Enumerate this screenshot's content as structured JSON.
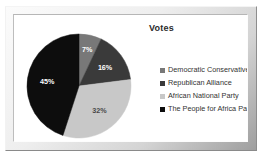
{
  "chart_data": {
    "type": "pie",
    "title": "Votes",
    "xlabel": "",
    "ylabel": "",
    "grid": false,
    "legend_position": "right",
    "value_unit": "%",
    "categories": [
      "Democratic Conservatives",
      "Republican Alliance",
      "African National Party",
      "The People for Africa Party"
    ],
    "values": [
      7,
      16,
      32,
      45
    ],
    "data_labels": [
      "7%",
      "16%",
      "32%",
      "45%"
    ],
    "colors": [
      "#787878",
      "#3a3a3a",
      "#c8c8c8",
      "#0d0d0d"
    ],
    "total": 100
  },
  "chart": {
    "title": "Votes",
    "slices": [
      {
        "label": "7%",
        "value": 7,
        "color": "#787878",
        "name": "Democratic Conservatives"
      },
      {
        "label": "16%",
        "value": 16,
        "color": "#3a3a3a",
        "name": "Republican Alliance"
      },
      {
        "label": "32%",
        "value": 32,
        "color": "#c8c8c8",
        "name": "African National Party"
      },
      {
        "label": "45%",
        "value": 45,
        "color": "#0d0d0d",
        "name": "The People for Africa Party"
      }
    ],
    "legend": [
      {
        "label": "Democratic Conservatives",
        "color": "#787878"
      },
      {
        "label": "Republican Alliance",
        "color": "#3a3a3a"
      },
      {
        "label": "African National Party",
        "color": "#c8c8c8"
      },
      {
        "label": "The People for Africa Party",
        "color": "#0d0d0d"
      }
    ]
  }
}
